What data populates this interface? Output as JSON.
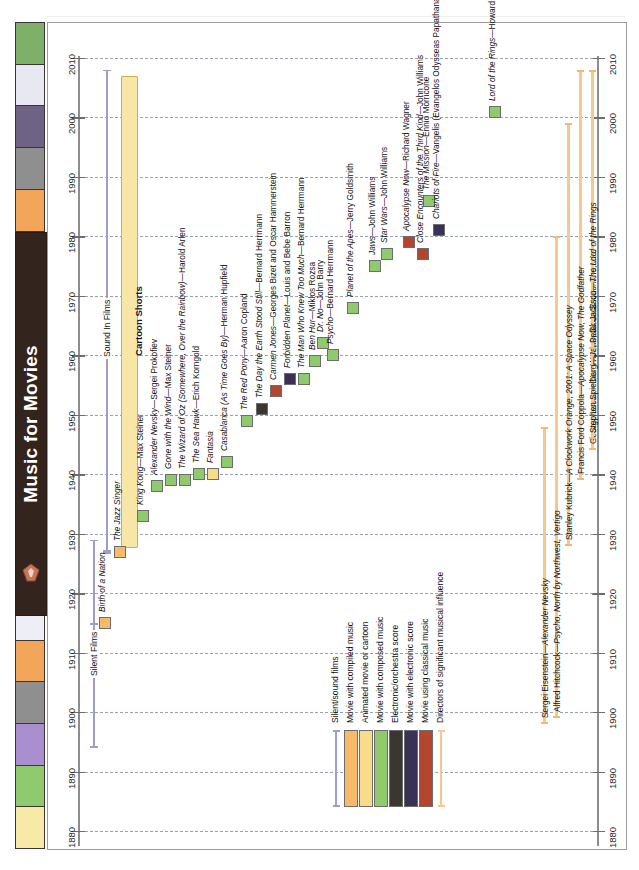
{
  "title": "Music for Movies",
  "axis": {
    "years": [
      2010,
      2000,
      1990,
      1980,
      1970,
      1960,
      1950,
      1940,
      1930,
      1920,
      1910,
      1900,
      1890,
      1880
    ],
    "min": 1880,
    "max": 2015
  },
  "eras": [
    {
      "name": "silent-films",
      "label": "Silent Films",
      "start": 1894,
      "end": 1929,
      "kind": "bracket"
    },
    {
      "name": "sound-in-films",
      "label": "Sound In Films",
      "start": 1927,
      "end": 2008,
      "kind": "bracket"
    },
    {
      "name": "cartoon-shorts",
      "label": "Cartoon Shorts",
      "start": 1928,
      "end": 2007,
      "kind": "bar",
      "color": "#f8e6a6"
    }
  ],
  "films": [
    {
      "title": "Birth of a Nation",
      "year": 1915,
      "color": "#f7b96a",
      "type": "compiled"
    },
    {
      "title": "The Jazz Singer",
      "year": 1927,
      "color": "#f7b96a",
      "type": "compiled"
    },
    {
      "title": "King Kong—Max Steiner",
      "year": 1933,
      "color": "#8fcb6e",
      "type": "composed"
    },
    {
      "title": "Alexander Nevsky—Sergei Prokofiev",
      "year": 1938,
      "color": "#8fcb6e",
      "type": "composed"
    },
    {
      "title": "Gone with the Wind—Max Steiner",
      "year": 1939,
      "color": "#8fcb6e",
      "type": "composed"
    },
    {
      "title": "The Wizard of Oz (Somewhere, Over the Rainbow)—Harold Arlen",
      "year": 1939,
      "color": "#8fcb6e",
      "type": "composed"
    },
    {
      "title": "The Sea Hawk—Erich Korngold",
      "year": 1940,
      "color": "#8fcb6e",
      "type": "composed"
    },
    {
      "title": "Fantasia",
      "year": 1940,
      "color": "#f7dd8a",
      "type": "animated"
    },
    {
      "title": "Casablanca (As Time Goes By)—Herman Hupfield",
      "year": 1942,
      "color": "#8fcb6e",
      "type": "composed"
    },
    {
      "title": "The Red Pony—Aaron Copland",
      "year": 1949,
      "color": "#8fcb6e",
      "type": "composed"
    },
    {
      "title": "The Day the Earth Stood Still—Bernard Herrmann",
      "year": 1951,
      "color": "#3b3631",
      "type": "electronic-orchestra"
    },
    {
      "title": "Carmen Jones—Georges Bizet and Oscar Hammerstein",
      "year": 1954,
      "color": "#b4462f",
      "type": "classical"
    },
    {
      "title": "Forbidden Planet—Louis and Bebe Barron",
      "year": 1956,
      "color": "#3a3157",
      "type": "electronic"
    },
    {
      "title": "The Man Who Knew Too Much—Bernard Herrmann",
      "year": 1956,
      "color": "#8fcb6e",
      "type": "composed"
    },
    {
      "title": "Dr. No—John Barry",
      "year": 1962,
      "color": "#8fcb6e",
      "type": "composed"
    },
    {
      "title": "Ben Hur—Miklos Rozsa",
      "year": 1959,
      "color": "#8fcb6e",
      "type": "composed"
    },
    {
      "title": "Psycho—Bernard Herrmann",
      "year": 1960,
      "color": "#8fcb6e",
      "type": "composed"
    },
    {
      "title": "Planet of the Apes—Jerry Goldsmith",
      "year": 1968,
      "color": "#8fcb6e",
      "type": "composed"
    },
    {
      "title": "Jaws—John Williams",
      "year": 1975,
      "color": "#8fcb6e",
      "type": "composed"
    },
    {
      "title": "Star Wars—John Williams",
      "year": 1977,
      "color": "#8fcb6e",
      "type": "composed"
    },
    {
      "title": "The Mission—Ennio Morricone",
      "year": 1986,
      "color": "#8fcb6e",
      "type": "composed"
    },
    {
      "title": "Apocalypse Now—Richard Wagner",
      "year": 1979,
      "color": "#b4462f",
      "type": "classical"
    },
    {
      "title": "Close Encounters of the Third Kind—John Williams",
      "year": 1977,
      "color": "#b4462f",
      "type": "classical"
    },
    {
      "title": "Chariots of Fire—Vangelis (Evangelos Odysseas Papathanassiou)",
      "year": 1981,
      "color": "#3a3157",
      "type": "electronic"
    },
    {
      "title": "Lord of the Rings—Howard Shore",
      "year": 2001,
      "color": "#8fcb6e",
      "type": "composed"
    }
  ],
  "directors": [
    {
      "name": "Sergei Eisenstein—Alexander Nevsky",
      "start": 1898,
      "end": 1948
    },
    {
      "name": "Alfred Hitchcock—Psycho, North by Northwest, Vertigo",
      "start": 1899,
      "end": 1980
    },
    {
      "name": "Stanley Kubrick—A Clockwork Orange, 2001: A Space Odyssey",
      "start": 1928,
      "end": 1999
    },
    {
      "name": "Francis Ford Coppola—Apocalypse Now, The Godfather",
      "start": 1939,
      "end": 2008
    },
    {
      "name": "George Lucas—Star Wars, Indiana Jones",
      "start": 1944,
      "end": 2008
    },
    {
      "name": "Stephen Spielberg—Jaws, Close Encounters, etc.",
      "start": 1946,
      "end": 2008
    },
    {
      "name": "Peter Jackson—The Lord of the Rings",
      "start": 1961,
      "end": 2008
    }
  ],
  "legend": [
    {
      "label": "Silent/sound films",
      "color": "#9f9ec9",
      "shape": "line"
    },
    {
      "label": "Movie with compiled music",
      "color": "#f7b96a",
      "shape": "box"
    },
    {
      "label": "Animated movie or cartoon",
      "color": "#f7dd8a",
      "shape": "box"
    },
    {
      "label": "Movie with composed music",
      "color": "#8fcb6e",
      "shape": "box"
    },
    {
      "label": "Electronic/orchestra score",
      "color": "#3b3631",
      "shape": "box"
    },
    {
      "label": "Movie with electronic score",
      "color": "#3a3157",
      "shape": "box"
    },
    {
      "label": "Movie using classical music",
      "color": "#b4462f",
      "shape": "box"
    },
    {
      "label": "Directors of significant musical influence",
      "color": "#f5c98e",
      "shape": "line"
    }
  ],
  "swatch_colors": [
    "#7fb069",
    "#e8e8f2",
    "#6e6384",
    "#8f8f8f",
    "#f2a65a",
    "#8fcb6e",
    "#f5e6a0",
    "#b8a8d4",
    "#33241d",
    "#33241d",
    "#33241d",
    "#33241d",
    "#7a7490",
    "#6f9d60",
    "#eeeef6",
    "#f2a65a",
    "#8f8f8f",
    "#a98fd0",
    "#8fcb6e",
    "#f7e9a8"
  ]
}
